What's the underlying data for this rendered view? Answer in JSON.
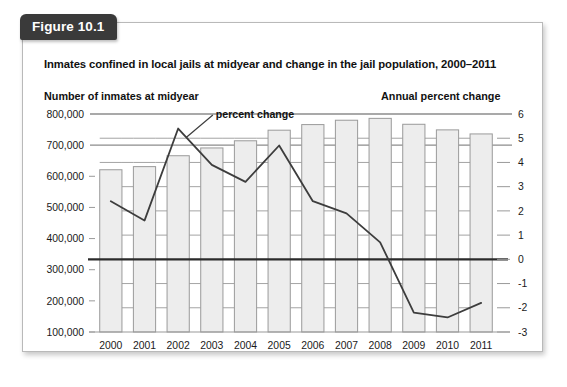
{
  "figure": {
    "tab_label": "Figure 10.1",
    "title": "Inmates confined in local jails at midyear and change in the jail population, 2000–2011"
  },
  "axes": {
    "left_header": "Number of inmates at midyear",
    "right_header": "Annual percent change"
  },
  "annotation": {
    "percent_change_label": "percent change"
  },
  "colors": {
    "bar_fill": "#ededed",
    "bar_stroke": "#9a9a9a",
    "line_color": "#3d3d3d",
    "zero_line": "#2b2b2b",
    "grid_color": "#8c8c8c",
    "tab_background": "#3a3a3a",
    "card_border": "#b9b9b9",
    "text": "#111111"
  },
  "chart_data": {
    "type": "bar",
    "title": "Inmates confined in local jails at midyear and change in the jail population, 2000–2011",
    "xlabel": "",
    "ylabel": "Number of inmates at midyear",
    "y2label": "Annual percent change",
    "grid": true,
    "legend_position": "inline-annotation",
    "categories": [
      "2000",
      "2001",
      "2002",
      "2003",
      "2004",
      "2005",
      "2006",
      "2007",
      "2008",
      "2009",
      "2010",
      "2011"
    ],
    "ylim": [
      100000,
      800000
    ],
    "yticks": [
      "800,000",
      "700,000",
      "600,000",
      "500,000",
      "400,000",
      "300,000",
      "200,000",
      "100,000"
    ],
    "ytick_values": [
      800000,
      700000,
      600000,
      500000,
      400000,
      300000,
      200000,
      100000
    ],
    "y2lim": [
      -3,
      6
    ],
    "y2ticks": [
      "6",
      "5",
      "4",
      "3",
      "2",
      "1",
      "0",
      "-1",
      "-2",
      "-3"
    ],
    "y2tick_values": [
      6,
      5,
      4,
      3,
      2,
      1,
      0,
      -1,
      -2,
      -3
    ],
    "series": [
      {
        "name": "Number of inmates at midyear",
        "type": "bar",
        "axis": "left",
        "values": [
          621000,
          631000,
          666000,
          691000,
          714000,
          748000,
          766000,
          780000,
          786000,
          767000,
          749000,
          736000
        ]
      },
      {
        "name": "percent change",
        "type": "line",
        "axis": "right",
        "values": [
          2.4,
          1.6,
          5.4,
          3.9,
          3.2,
          4.7,
          2.4,
          1.9,
          0.7,
          -2.2,
          -2.4,
          -1.8
        ]
      }
    ]
  }
}
